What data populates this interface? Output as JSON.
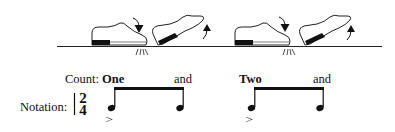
{
  "diagram": {
    "title": "",
    "steps": [
      {
        "shoe": "flat",
        "action": "heel-drop",
        "arrow": "down",
        "impact": true
      },
      {
        "shoe": "toe-raised",
        "action": "toe-lift",
        "arrow": "up",
        "impact": false
      },
      {
        "shoe": "flat",
        "action": "heel-drop",
        "arrow": "down",
        "impact": true
      },
      {
        "shoe": "toe-raised",
        "action": "toe-lift",
        "arrow": "up",
        "impact": false
      }
    ],
    "count": {
      "label": "Count:",
      "beats": [
        "One",
        "and",
        "Two",
        "and"
      ]
    },
    "notation": {
      "label": "Notation:",
      "time_signature": {
        "top": "2",
        "bottom": "4"
      },
      "accent_symbol": ">"
    }
  }
}
